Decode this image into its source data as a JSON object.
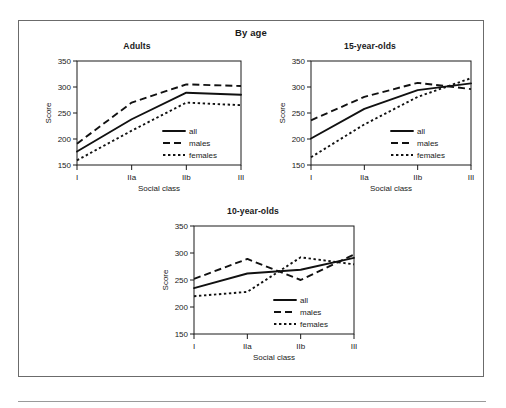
{
  "figure": {
    "title": "By age",
    "axis": {
      "xlabel": "Social class",
      "ylabel": "Score",
      "categories": [
        "I",
        "IIa",
        "IIb",
        "III"
      ],
      "yticks": [
        "150",
        "200",
        "250",
        "300",
        "350"
      ],
      "ylim": [
        150,
        350
      ]
    },
    "legend": {
      "all": "all",
      "males": "males",
      "females": "females"
    }
  },
  "chart_data": [
    {
      "type": "line",
      "title": "Adults",
      "xlabel": "Social class",
      "ylabel": "Score",
      "categories": [
        "I",
        "IIa",
        "IIb",
        "III"
      ],
      "ylim": [
        150,
        350
      ],
      "yticks": [
        150,
        200,
        250,
        300,
        350
      ],
      "grid": false,
      "legend_position": "lower-right",
      "series": [
        {
          "name": "all",
          "style": "solid",
          "values": [
            176,
            238,
            289,
            285
          ]
        },
        {
          "name": "males",
          "style": "dashed",
          "values": [
            191,
            270,
            305,
            302
          ]
        },
        {
          "name": "females",
          "style": "dotted",
          "values": [
            159,
            216,
            270,
            265
          ]
        }
      ]
    },
    {
      "type": "line",
      "title": "15-year-olds",
      "xlabel": "Social class",
      "ylabel": "Score",
      "categories": [
        "I",
        "IIa",
        "IIb",
        "III"
      ],
      "ylim": [
        150,
        350
      ],
      "yticks": [
        150,
        200,
        250,
        300,
        350
      ],
      "grid": false,
      "legend_position": "lower-right",
      "series": [
        {
          "name": "all",
          "style": "solid",
          "values": [
            201,
            258,
            294,
            307
          ]
        },
        {
          "name": "males",
          "style": "dashed",
          "values": [
            236,
            281,
            308,
            296
          ]
        },
        {
          "name": "females",
          "style": "dotted",
          "values": [
            165,
            228,
            281,
            317
          ]
        }
      ]
    },
    {
      "type": "line",
      "title": "10-year-olds",
      "xlabel": "Social class",
      "ylabel": "Score",
      "categories": [
        "I",
        "IIa",
        "IIb",
        "III"
      ],
      "ylim": [
        150,
        350
      ],
      "yticks": [
        150,
        200,
        250,
        300,
        350
      ],
      "grid": false,
      "legend_position": "lower-right",
      "series": [
        {
          "name": "all",
          "style": "solid",
          "values": [
            235,
            262,
            269,
            291
          ]
        },
        {
          "name": "males",
          "style": "dashed",
          "values": [
            252,
            289,
            250,
            297
          ]
        },
        {
          "name": "females",
          "style": "dotted",
          "values": [
            220,
            228,
            292,
            279
          ]
        }
      ]
    }
  ]
}
